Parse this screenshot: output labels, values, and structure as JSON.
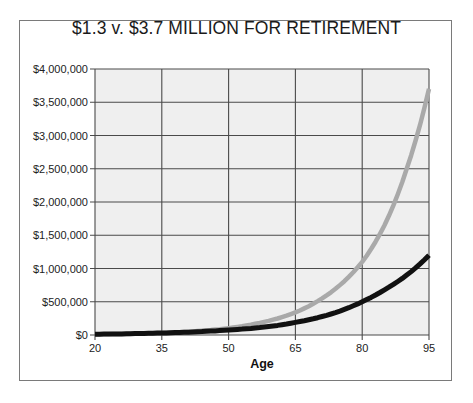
{
  "chart_data": {
    "type": "line",
    "title": "$1.3 v. $3.7 MILLION FOR RETIREMENT",
    "xlabel": "Age",
    "ylabel": "",
    "x": [
      20,
      25,
      30,
      35,
      40,
      45,
      50,
      55,
      60,
      65,
      70,
      75,
      80,
      85,
      90,
      95
    ],
    "xticks": [
      20,
      35,
      50,
      65,
      80,
      95
    ],
    "xlim": [
      20,
      95
    ],
    "ylim": [
      0,
      4000000
    ],
    "yticks": [
      0,
      500000,
      1000000,
      1500000,
      2000000,
      2500000,
      3000000,
      3500000,
      4000000
    ],
    "ytick_labels": [
      "$0",
      "$500,000",
      "$1,000,000",
      "$1,500,000",
      "$2,000,000",
      "$2,500,000",
      "$3,000,000",
      "$3,500,000",
      "$4,000,000"
    ],
    "grid": true,
    "legend": "none",
    "series": [
      {
        "name": "Higher-growth scenario (gray)",
        "color": "#a9a9a9",
        "values": [
          9000,
          14000,
          21000,
          30000,
          46000,
          70000,
          102000,
          155000,
          230000,
          340000,
          510000,
          750000,
          1100000,
          1650000,
          2500000,
          3700000
        ]
      },
      {
        "name": "Lower-growth scenario (black)",
        "color": "#111111",
        "values": [
          12000,
          16000,
          22000,
          30000,
          40000,
          55000,
          75000,
          100000,
          135000,
          190000,
          260000,
          360000,
          500000,
          680000,
          900000,
          1200000
        ]
      }
    ]
  },
  "colors": {
    "plot_background": "#efefef",
    "gridline": "#4a4a4a",
    "frame_border": "#7a7a7a"
  }
}
